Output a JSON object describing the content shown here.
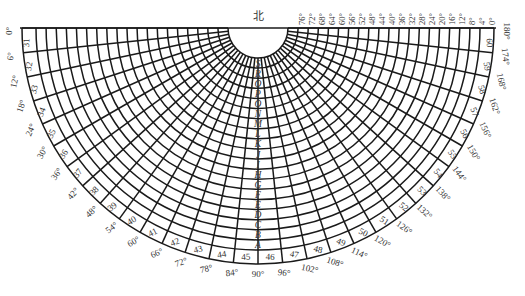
{
  "diagram": {
    "north_label": "北",
    "center": {
      "x": 258,
      "y": 28
    },
    "inner_radius": 30,
    "outer_radius": 236,
    "line_color": "#1a1a1a",
    "text_color": "#333333",
    "top_degree_labels": [
      "76°",
      "72°",
      "68°",
      "64°",
      "60°",
      "56°",
      "52°",
      "48°",
      "44°",
      "40°",
      "36°",
      "32°",
      "28°",
      "24°",
      "20°",
      "16°",
      "12°",
      "8°",
      "4°",
      "0°"
    ],
    "perimeter_degree_labels": [
      "0°",
      "6°",
      "12°",
      "18°",
      "24°",
      "30°",
      "36°",
      "42°",
      "48°",
      "54°",
      "60°",
      "66°",
      "72°",
      "78°",
      "84°",
      "90°",
      "96°",
      "102°",
      "108°",
      "114°",
      "120°",
      "126°",
      "132°",
      "138°",
      "144°",
      "150°",
      "156°",
      "162°",
      "168°",
      "174°",
      "180°"
    ],
    "sector_numbers": [
      "31",
      "32",
      "33",
      "34",
      "35",
      "36",
      "37",
      "38",
      "39",
      "40",
      "41",
      "42",
      "43",
      "44",
      "45",
      "46",
      "47",
      "48",
      "49",
      "50",
      "51",
      "52",
      "53",
      "54",
      "55",
      "56",
      "57",
      "58",
      "59",
      "60"
    ],
    "ring_letters": [
      "A",
      "B",
      "C",
      "D",
      "E",
      "F",
      "G",
      "H",
      "I",
      "J",
      "K",
      "L",
      "M",
      "N",
      "O",
      "P",
      "Q",
      "R",
      "S"
    ]
  }
}
